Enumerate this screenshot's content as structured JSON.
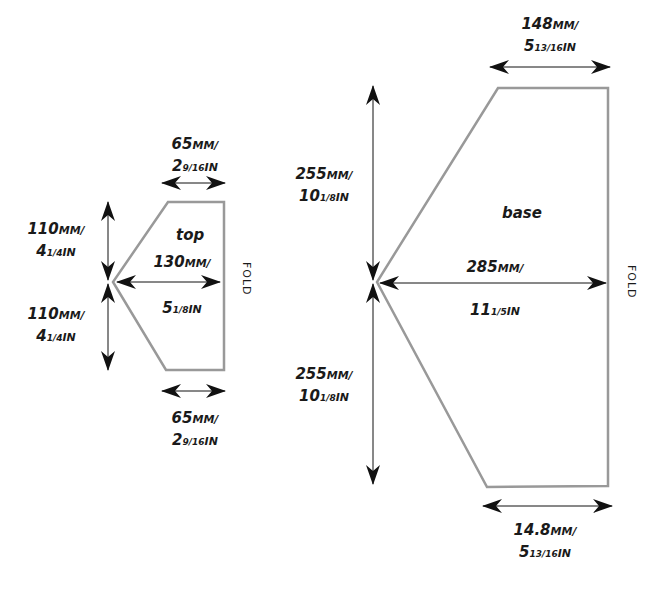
{
  "pieces": {
    "top": {
      "name": "top",
      "fold": "FOLD",
      "top_width": {
        "mm": "65",
        "mm_unit": "MM/",
        "in_whole": "2",
        "in_frac": "9/16",
        "in_unit": "IN"
      },
      "bottom_width": {
        "mm": "65",
        "mm_unit": "MM/",
        "in_whole": "2",
        "in_frac": "9/16",
        "in_unit": "IN"
      },
      "upper_height": {
        "mm": "110",
        "mm_unit": "MM/",
        "in_whole": "4",
        "in_frac": "1/4",
        "in_unit": "IN"
      },
      "lower_height": {
        "mm": "110",
        "mm_unit": "MM/",
        "in_whole": "4",
        "in_frac": "1/4",
        "in_unit": "IN"
      },
      "length": {
        "mm": "130",
        "mm_unit": "MM/",
        "in_whole": "5",
        "in_frac": "1/8",
        "in_unit": "IN"
      }
    },
    "base": {
      "name": "base",
      "fold": "FOLD",
      "top_width": {
        "mm": "148",
        "mm_unit": "MM/",
        "in_whole": "5",
        "in_frac": "13/16",
        "in_unit": "IN"
      },
      "bottom_width": {
        "mm": "14.8",
        "mm_unit": "MM/",
        "in_whole": "5",
        "in_frac": "13/16",
        "in_unit": "IN"
      },
      "upper_height": {
        "mm": "255",
        "mm_unit": "MM/",
        "in_whole": "10",
        "in_frac": "1/8",
        "in_unit": "IN"
      },
      "lower_height": {
        "mm": "255",
        "mm_unit": "MM/",
        "in_whole": "10",
        "in_frac": "1/8",
        "in_unit": "IN"
      },
      "length": {
        "mm": "285",
        "mm_unit": "MM/",
        "in_whole": "11",
        "in_frac": "1/5",
        "in_unit": "IN"
      }
    }
  },
  "colors": {
    "outline": "#999999",
    "arrow": "#111111",
    "text": "#1a1a1a"
  }
}
